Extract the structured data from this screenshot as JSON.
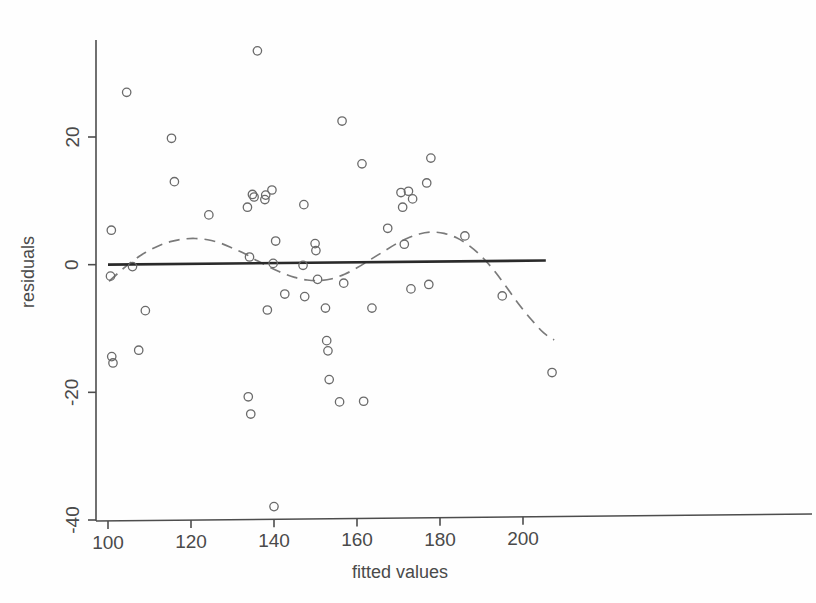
{
  "chart_data": {
    "type": "scatter",
    "title": "",
    "xlabel": "fitted values",
    "ylabel": "residuals",
    "xlim": [
      96,
      212
    ],
    "ylim": [
      -41,
      36
    ],
    "xticks": [
      100,
      120,
      140,
      160,
      180,
      200
    ],
    "xtick_labels": [
      "100",
      "120",
      "140",
      "160",
      "180",
      "200"
    ],
    "yticks": [
      20,
      0,
      -20,
      -40
    ],
    "ytick_labels": [
      "20",
      "0",
      "-20",
      "-40"
    ],
    "grid": false,
    "legend": null,
    "marker": "open-circle",
    "marker_color": "#6a6a6a",
    "points": [
      {
        "x": 100.6,
        "y": -1.8
      },
      {
        "x": 100.8,
        "y": 5.4
      },
      {
        "x": 100.9,
        "y": -14.4
      },
      {
        "x": 101.2,
        "y": -15.4
      },
      {
        "x": 104.5,
        "y": 27.0
      },
      {
        "x": 105.9,
        "y": -0.3
      },
      {
        "x": 107.4,
        "y": -13.4
      },
      {
        "x": 109.0,
        "y": -7.2
      },
      {
        "x": 115.3,
        "y": 19.8
      },
      {
        "x": 116.0,
        "y": 13.0
      },
      {
        "x": 124.3,
        "y": 7.8
      },
      {
        "x": 133.6,
        "y": 9.0
      },
      {
        "x": 133.8,
        "y": -20.7
      },
      {
        "x": 134.1,
        "y": 1.2
      },
      {
        "x": 134.4,
        "y": -23.4
      },
      {
        "x": 134.8,
        "y": 11.0
      },
      {
        "x": 135.2,
        "y": 10.6
      },
      {
        "x": 136.0,
        "y": 33.5
      },
      {
        "x": 137.8,
        "y": 10.2
      },
      {
        "x": 138.0,
        "y": 10.9
      },
      {
        "x": 138.4,
        "y": -7.1
      },
      {
        "x": 139.5,
        "y": 11.7
      },
      {
        "x": 139.8,
        "y": 0.2
      },
      {
        "x": 140.0,
        "y": -37.9
      },
      {
        "x": 140.4,
        "y": 3.7
      },
      {
        "x": 142.6,
        "y": -4.6
      },
      {
        "x": 147.0,
        "y": -0.1
      },
      {
        "x": 147.2,
        "y": 9.4
      },
      {
        "x": 147.4,
        "y": -5.0
      },
      {
        "x": 149.9,
        "y": 3.3
      },
      {
        "x": 150.1,
        "y": 2.2
      },
      {
        "x": 150.5,
        "y": -2.3
      },
      {
        "x": 152.4,
        "y": -6.8
      },
      {
        "x": 152.7,
        "y": -11.9
      },
      {
        "x": 153.0,
        "y": -13.5
      },
      {
        "x": 153.3,
        "y": -18.0
      },
      {
        "x": 155.8,
        "y": -21.5
      },
      {
        "x": 156.4,
        "y": 22.5
      },
      {
        "x": 156.8,
        "y": -2.9
      },
      {
        "x": 161.2,
        "y": 15.8
      },
      {
        "x": 161.6,
        "y": -21.4
      },
      {
        "x": 163.6,
        "y": -6.8
      },
      {
        "x": 167.4,
        "y": 5.7
      },
      {
        "x": 170.6,
        "y": 11.3
      },
      {
        "x": 171.0,
        "y": 9.0
      },
      {
        "x": 171.4,
        "y": 3.2
      },
      {
        "x": 172.4,
        "y": 11.5
      },
      {
        "x": 173.0,
        "y": -3.8
      },
      {
        "x": 173.4,
        "y": 10.3
      },
      {
        "x": 176.8,
        "y": 12.8
      },
      {
        "x": 177.3,
        "y": -3.1
      },
      {
        "x": 177.8,
        "y": 16.7
      },
      {
        "x": 186.0,
        "y": 4.5
      },
      {
        "x": 195.0,
        "y": -4.9
      },
      {
        "x": 207.0,
        "y": -16.9
      }
    ],
    "reference_line": {
      "style": "solid",
      "color": "#2a2a2a",
      "label": "zero reference line",
      "x_start": 100.0,
      "x_end": 205.5,
      "y_start": 0.0,
      "y_end": 0.65
    },
    "smoother": {
      "style": "dashed",
      "color": "#7a7a7a",
      "label": "lowess smoother",
      "x": [
        100.3,
        103.0,
        106.0,
        109.0,
        112.0,
        115.0,
        118.0,
        121.0,
        124.0,
        127.0,
        130.0,
        133.0,
        136.0,
        139.0,
        142.0,
        145.0,
        148.0,
        151.0,
        154.0,
        157.0,
        160.0,
        163.0,
        166.0,
        169.0,
        172.0,
        175.0,
        178.0,
        181.0,
        184.0,
        187.0,
        190.0,
        193.0,
        196.0,
        199.0,
        202.0,
        205.0,
        207.5
      ],
      "y": [
        -2.6,
        -1.0,
        0.6,
        1.9,
        2.9,
        3.6,
        4.0,
        4.1,
        3.9,
        3.4,
        2.6,
        1.7,
        0.6,
        -0.4,
        -1.3,
        -2.0,
        -2.4,
        -2.5,
        -2.2,
        -1.5,
        -0.5,
        0.7,
        1.9,
        3.1,
        4.1,
        4.8,
        5.1,
        4.9,
        4.2,
        3.0,
        1.3,
        -0.9,
        -3.5,
        -6.2,
        -8.6,
        -10.7,
        -11.8
      ]
    }
  },
  "axes": {
    "xaxis_name": "x-axis",
    "yaxis_name": "y-axis"
  }
}
